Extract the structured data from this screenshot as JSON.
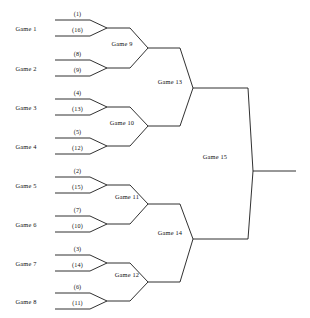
{
  "diagram": {
    "type": "single-elimination-tournament-bracket",
    "title": "",
    "team_count": 16,
    "game_count": 15,
    "canvas": {
      "width": 310,
      "height": 318
    },
    "style": {
      "background": "#ffffff",
      "line_color": "#1a1a1a",
      "text_color": "#111111"
    }
  },
  "round1": {
    "label_x": 26,
    "line_start_x": 55,
    "line_end_x": 90,
    "apex_x": 107,
    "out_end_x": 130,
    "games": [
      {
        "name": "Game 1",
        "label_y": 28,
        "top_y": 20,
        "bottom_y": 36,
        "apex_y": 28,
        "seeds": [
          "(1)",
          "(16)"
        ]
      },
      {
        "name": "Game 2",
        "label_y": 68,
        "top_y": 60,
        "bottom_y": 76,
        "apex_y": 68,
        "seeds": [
          "(8)",
          "(9)"
        ]
      },
      {
        "name": "Game 3",
        "label_y": 107,
        "top_y": 99,
        "bottom_y": 115,
        "apex_y": 107,
        "seeds": [
          "(4)",
          "(13)"
        ]
      },
      {
        "name": "Game 4",
        "label_y": 146,
        "top_y": 138,
        "bottom_y": 154,
        "apex_y": 146,
        "seeds": [
          "(5)",
          "(12)"
        ]
      },
      {
        "name": "Game 5",
        "label_y": 185,
        "top_y": 177,
        "bottom_y": 193,
        "apex_y": 185,
        "seeds": [
          "(2)",
          "(15)"
        ]
      },
      {
        "name": "Game 6",
        "label_y": 224,
        "top_y": 216,
        "bottom_y": 232,
        "apex_y": 224,
        "seeds": [
          "(7)",
          "(10)"
        ]
      },
      {
        "name": "Game 7",
        "label_y": 263,
        "top_y": 255,
        "bottom_y": 271,
        "apex_y": 263,
        "seeds": [
          "(3)",
          "(14)"
        ]
      },
      {
        "name": "Game 8",
        "label_y": 301,
        "top_y": 293,
        "bottom_y": 309,
        "apex_y": 301,
        "seeds": [
          "(6)",
          "(11)"
        ]
      }
    ]
  },
  "round2": {
    "apex_x": 148,
    "out_end_x": 180,
    "games": [
      {
        "name": "Game 9",
        "label_x": 122,
        "label_y": 43,
        "in_top_y": 28,
        "in_bottom_y": 68,
        "apex_y": 48
      },
      {
        "name": "Game 10",
        "label_x": 122,
        "label_y": 122,
        "in_top_y": 107,
        "in_bottom_y": 146,
        "apex_y": 126
      },
      {
        "name": "Game 11",
        "label_x": 127,
        "label_y": 196,
        "in_top_y": 185,
        "in_bottom_y": 224,
        "apex_y": 204
      },
      {
        "name": "Game 12",
        "label_x": 127,
        "label_y": 274,
        "in_top_y": 263,
        "in_bottom_y": 301,
        "apex_y": 282
      }
    ]
  },
  "round3": {
    "apex_x": 193,
    "out_end_x": 248,
    "games": [
      {
        "name": "Game 13",
        "label_x": 170,
        "label_y": 81,
        "in_top_y": 48,
        "in_bottom_y": 126,
        "apex_y": 88
      },
      {
        "name": "Game 14",
        "label_x": 170,
        "label_y": 232,
        "in_top_y": 204,
        "in_bottom_y": 282,
        "apex_y": 239
      }
    ]
  },
  "final": {
    "name": "Game 15",
    "label_x": 215,
    "label_y": 156,
    "apex_x": 253,
    "apex_y": 171,
    "in_top_y": 88,
    "in_bottom_y": 239,
    "champion_line_end_x": 296
  }
}
